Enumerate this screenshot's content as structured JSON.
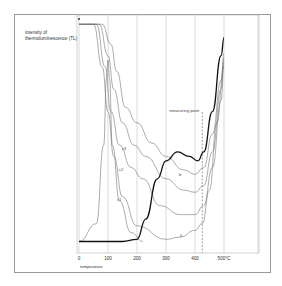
{
  "chart_data": {
    "type": "line",
    "title": "",
    "ylabel": "intensity of thermoluminescence (TL)",
    "xlabel": "temperature",
    "x_unit": "°C",
    "xlim": [
      0,
      600
    ],
    "x_ticks": [
      0,
      100,
      200,
      300,
      400,
      500
    ],
    "x_tick_labels": [
      "0",
      "100",
      "200",
      "300",
      "400",
      "500°C"
    ],
    "grid": "vertical",
    "annotations": [
      {
        "text": "measuring point",
        "x": 425,
        "style": "dashed vertical line"
      }
    ],
    "series": [
      {
        "name": "0",
        "style": "thin",
        "note": "lowest thin curve, label '0'",
        "x": [
          0,
          50,
          80,
          100,
          120,
          150,
          200,
          300,
          350,
          400,
          425,
          450,
          475,
          500
        ],
        "y": [
          0.99,
          0.99,
          0.8,
          0.6,
          0.4,
          0.22,
          0.09,
          0.03,
          0.04,
          0.07,
          0.1,
          0.25,
          0.55,
          0.8
        ]
      },
      {
        "name": "c1",
        "style": "thin",
        "x": [
          0,
          60,
          90,
          110,
          140,
          180,
          220,
          280,
          350,
          400,
          430,
          460,
          490,
          500
        ],
        "y": [
          0.99,
          0.99,
          0.8,
          0.6,
          0.45,
          0.35,
          0.3,
          0.18,
          0.14,
          0.14,
          0.18,
          0.35,
          0.65,
          0.82
        ]
      },
      {
        "name": "c2",
        "style": "thin",
        "x": [
          0,
          70,
          100,
          120,
          150,
          190,
          230,
          300,
          360,
          400,
          430,
          460,
          490,
          500
        ],
        "y": [
          0.99,
          0.99,
          0.85,
          0.7,
          0.55,
          0.45,
          0.4,
          0.3,
          0.25,
          0.24,
          0.27,
          0.42,
          0.7,
          0.84
        ]
      },
      {
        "name": "c3",
        "style": "thin",
        "x": [
          0,
          80,
          110,
          130,
          160,
          200,
          250,
          300,
          360,
          400,
          430,
          460,
          490,
          500
        ],
        "y": [
          0.99,
          0.99,
          0.9,
          0.78,
          0.62,
          0.55,
          0.46,
          0.4,
          0.34,
          0.32,
          0.35,
          0.5,
          0.74,
          0.86
        ]
      },
      {
        "name": "peak curve",
        "style": "thin",
        "note": "sharp glow peak near 100°C",
        "x": [
          0,
          60,
          85,
          95,
          100,
          105,
          115,
          140,
          180,
          220
        ],
        "y": [
          0.02,
          0.1,
          0.45,
          0.75,
          0.83,
          0.75,
          0.45,
          0.2,
          0.06,
          0.02
        ]
      },
      {
        "name": "b (natural)",
        "style": "bold",
        "x": [
          0,
          100,
          150,
          200,
          230,
          270,
          300,
          340,
          380,
          410,
          430,
          460,
          490,
          500
        ],
        "y": [
          0.02,
          0.02,
          0.02,
          0.03,
          0.12,
          0.3,
          0.38,
          0.42,
          0.4,
          0.38,
          0.42,
          0.6,
          0.85,
          0.93
        ]
      }
    ]
  }
}
